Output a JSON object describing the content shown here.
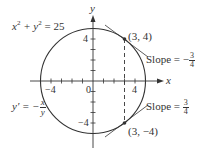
{
  "equation": {
    "lhs": "x",
    "sup1": "2",
    "plus": " + y",
    "sup2": "2",
    "rhs": " = 25"
  },
  "derivative": {
    "lhs": "y′ = −",
    "num": "x",
    "den": "y"
  },
  "axes": {
    "x_label": "x",
    "y_label": "y"
  },
  "ticks": {
    "x_neg": "−4",
    "x_pos": "4",
    "origin": "0",
    "y_pos": "4",
    "y_neg": "−4"
  },
  "points": [
    {
      "label": "(3, 4)",
      "x": 3,
      "y": 4
    },
    {
      "label": "(3, −4)",
      "x": 3,
      "y": -4
    }
  ],
  "slopes": [
    {
      "text": "Slope = −",
      "num": "3",
      "den": "4"
    },
    {
      "text": "Slope = ",
      "num": "3",
      "den": "4"
    }
  ],
  "colors": {
    "stroke": "#333333",
    "background": "#ffffff"
  }
}
